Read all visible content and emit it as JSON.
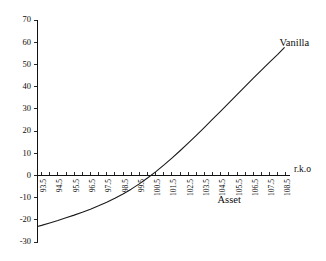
{
  "chart_data": {
    "type": "line",
    "title": "",
    "subtitle": "",
    "xlabel": "r.k.o",
    "ylabel": "",
    "xlim": [
      93.25,
      108.75
    ],
    "ylim": [
      -30,
      70
    ],
    "grid": false,
    "legend_position": "inline-annotations",
    "x_tick_labels": [
      "93.5",
      "94.5",
      "95.5",
      "96.5",
      "97.5",
      "98.5",
      "99.5",
      "100.5",
      "101.5",
      "102.5",
      "103.5",
      "104.5",
      "105.5",
      "106.5",
      "107.5",
      "108.5"
    ],
    "x_tick_values": [
      93.5,
      94.5,
      95.5,
      96.5,
      97.5,
      98.5,
      99.5,
      100.5,
      101.5,
      102.5,
      103.5,
      104.5,
      105.5,
      106.5,
      107.5,
      108.5
    ],
    "x_minor_step": 0.5,
    "y_tick_labels": [
      "70",
      "60",
      "50",
      "40",
      "30",
      "20",
      "10",
      "0",
      "-10",
      "-20",
      "-30"
    ],
    "y_tick_values": [
      70,
      60,
      50,
      40,
      30,
      20,
      10,
      0,
      -10,
      -20,
      -30
    ],
    "annotations": [
      {
        "text": "Vanilla",
        "x": 108.1,
        "y": 59.5
      },
      {
        "text": "Asset",
        "x": 104.3,
        "y": -11.5
      },
      {
        "text": "r.k.o",
        "x": 109.0,
        "y": 2.5
      }
    ],
    "series": [
      {
        "name": "Vanilla",
        "x": [
          93.25,
          93.5,
          94.0,
          94.5,
          95.0,
          95.5,
          96.0,
          96.5,
          97.0,
          97.5,
          98.0,
          98.5,
          99.0,
          99.5,
          100.0,
          100.5,
          101.0,
          101.5,
          102.0,
          102.5,
          103.0,
          103.5,
          104.0,
          104.5,
          105.0,
          105.5,
          106.0,
          106.5,
          107.0,
          107.5,
          108.0,
          108.4
        ],
        "values": [
          -23.0,
          -22.5,
          -21.4,
          -20.3,
          -19.1,
          -17.9,
          -16.6,
          -15.2,
          -13.7,
          -12.1,
          -10.3,
          -8.4,
          -6.2,
          -3.8,
          -1.2,
          1.6,
          4.6,
          7.8,
          11.1,
          14.5,
          18.0,
          21.6,
          25.3,
          29.0,
          32.7,
          36.4,
          40.1,
          43.8,
          47.4,
          51.0,
          54.5,
          57.6
        ]
      }
    ]
  },
  "axes": {
    "y_axis_name": "y-axis",
    "x_axis_name": "x-axis"
  }
}
